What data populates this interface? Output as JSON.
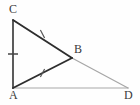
{
  "figure": {
    "background_color": "#fefefe",
    "width": 140,
    "height": 105,
    "points": {
      "A": {
        "label": "A",
        "x": 13,
        "y": 88
      },
      "B": {
        "label": "B",
        "x": 72,
        "y": 58
      },
      "C": {
        "label": "C",
        "x": 13,
        "y": 20
      },
      "D": {
        "label": "D",
        "x": 128,
        "y": 88
      }
    },
    "segments": [
      {
        "name": "segment-AC",
        "from": "A",
        "to": "C",
        "color": "#333333",
        "width": 1.6,
        "style": "solid"
      },
      {
        "name": "segment-CB",
        "from": "C",
        "to": "B",
        "color": "#2e2e2e",
        "width": 1.9,
        "style": "solid"
      },
      {
        "name": "segment-AB",
        "from": "A",
        "to": "B",
        "color": "#2e2e2e",
        "width": 1.9,
        "style": "solid"
      },
      {
        "name": "segment-BD",
        "from": "B",
        "to": "D",
        "color": "#a6a6a6",
        "width": 1.2,
        "style": "solid"
      },
      {
        "name": "segment-AD",
        "from": "A",
        "to": "D",
        "color": "#a8a8a8",
        "width": 1.2,
        "style": "solid"
      }
    ],
    "tick_marks": [
      {
        "name": "tick-on-AC",
        "on_segment": "segment-AC",
        "count": 1,
        "cx": 13,
        "cy": 54,
        "angle_deg": 0,
        "length": 10,
        "color": "#444444"
      },
      {
        "name": "tick-on-CB",
        "on_segment": "segment-CB",
        "count": 1,
        "cx": 42.5,
        "cy": 34,
        "angle_deg": 62,
        "length": 9,
        "color": "#555555"
      },
      {
        "name": "tick-on-AB",
        "on_segment": "segment-AB",
        "count": 1,
        "cx": 42.5,
        "cy": 73,
        "angle_deg": 118,
        "length": 9,
        "color": "#555555"
      }
    ],
    "labels": {
      "C": "C",
      "B": "B",
      "A": "A",
      "D": "D"
    },
    "colors": {
      "dark_stroke": "#2e2e2e",
      "light_stroke": "#a7a7a7",
      "label_text": "#3a3a3a",
      "tick_stroke": "#4d4d4d"
    }
  }
}
